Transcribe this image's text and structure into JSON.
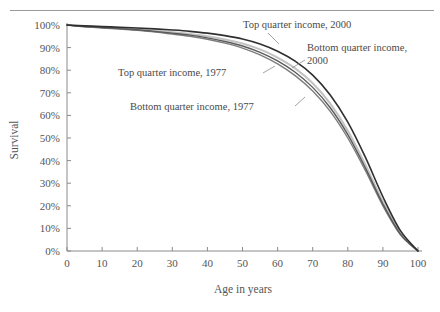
{
  "figure": {
    "background_color": "#ffffff",
    "rule_color": "#9a9a9a",
    "axis_color": "#8a8a8a",
    "text_color": "#555555"
  },
  "chart_data": {
    "type": "line",
    "title": "",
    "subtitle": "",
    "xlabel": "Age in years",
    "ylabel": "Survival",
    "xlim": [
      0,
      100
    ],
    "ylim": [
      0,
      100
    ],
    "grid": false,
    "legend_position": "inline-annotations",
    "x_ticks": [
      0,
      10,
      20,
      30,
      40,
      50,
      60,
      70,
      80,
      90,
      100
    ],
    "x_tick_labels": [
      "0",
      "10",
      "20",
      "30",
      "40",
      "50",
      "60",
      "70",
      "80",
      "90",
      "100"
    ],
    "y_ticks": [
      0,
      10,
      20,
      30,
      40,
      50,
      60,
      70,
      80,
      90,
      100
    ],
    "y_tick_labels": [
      "0%",
      "10%",
      "20%",
      "30%",
      "40%",
      "50%",
      "60%",
      "70%",
      "80%",
      "90%",
      "100%"
    ],
    "x": [
      0,
      5,
      10,
      15,
      20,
      25,
      30,
      35,
      40,
      45,
      50,
      55,
      60,
      65,
      70,
      75,
      80,
      85,
      90,
      95,
      100
    ],
    "series": [
      {
        "name": "Top quarter income, 2000",
        "color": "#2f2f2f",
        "width": 1.6,
        "values": [
          100,
          99.6,
          99.3,
          99.0,
          98.7,
          98.3,
          97.8,
          97.2,
          96.4,
          95.3,
          93.8,
          91.6,
          88.4,
          84.0,
          77.8,
          69.0,
          57.0,
          41.5,
          24.0,
          9.0,
          0
        ]
      },
      {
        "name": "Bottom quarter income, 2000",
        "color": "#c2c2c2",
        "width": 2.0,
        "values": [
          100,
          99.4,
          99.0,
          98.6,
          98.1,
          97.5,
          96.8,
          96.0,
          95.0,
          93.6,
          91.8,
          89.2,
          85.6,
          80.8,
          74.2,
          65.2,
          53.2,
          38.2,
          21.8,
          8.0,
          0
        ]
      },
      {
        "name": "Top quarter income, 1977",
        "color": "#5a5a5a",
        "width": 1.4,
        "values": [
          100,
          99.3,
          98.9,
          98.4,
          97.9,
          97.2,
          96.4,
          95.5,
          94.3,
          92.7,
          90.7,
          87.9,
          84.1,
          79.1,
          72.4,
          63.4,
          51.5,
          36.8,
          20.8,
          7.5,
          0
        ]
      },
      {
        "name": "Bottom quarter income, 1977",
        "color": "#7d7d7d",
        "width": 1.4,
        "values": [
          100,
          99.2,
          98.7,
          98.2,
          97.6,
          96.9,
          96.0,
          95.0,
          93.7,
          92.0,
          89.8,
          86.8,
          82.8,
          77.6,
          70.8,
          61.8,
          50.0,
          35.6,
          20.0,
          7.2,
          0
        ]
      }
    ],
    "annotations": [
      {
        "id": "annot-top-2000",
        "lines": [
          "Top quarter income, 2000"
        ],
        "text_x": 243,
        "text_y": 28,
        "leader": "M 268 33 L 279 44"
      },
      {
        "id": "annot-bottom-2000",
        "lines": [
          "Bottom quarter income,",
          "2000"
        ],
        "text_x": 307,
        "text_y": 51,
        "leader": "M 305 60 L 292 68"
      },
      {
        "id": "annot-top-1977",
        "lines": [
          "Top quarter income, 1977"
        ],
        "text_x": 118,
        "text_y": 76,
        "leader": "M 263 73 L 275 66"
      },
      {
        "id": "annot-bottom-1977",
        "lines": [
          "Bottom quarter income, 1977"
        ],
        "text_x": 130,
        "text_y": 110,
        "leader": "M 295 106 L 305 97"
      }
    ]
  }
}
